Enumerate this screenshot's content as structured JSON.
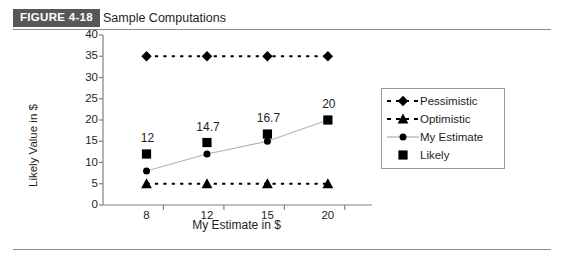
{
  "caption": {
    "badge": "FIGURE 4-18",
    "title": "Sample Computations"
  },
  "legend": {
    "items": [
      {
        "label": "Pessimistic",
        "key": "dashed-diamond-key"
      },
      {
        "label": "Optimistic",
        "key": "dashed-triangle-key"
      },
      {
        "label": "My Estimate",
        "key": "solid-circle-key"
      },
      {
        "label": "Likely",
        "key": "square-key"
      }
    ]
  },
  "chart_data": {
    "type": "line",
    "title": "Sample Computations",
    "xlabel": "My Estimate in $",
    "ylabel": "Likely Value in $",
    "categories": [
      "8",
      "12",
      "15",
      "20"
    ],
    "xtick_labels": [
      "8",
      "12",
      "15",
      "20"
    ],
    "ytick_labels": [
      "0",
      "5",
      "10",
      "15",
      "20",
      "25",
      "30",
      "35",
      "40"
    ],
    "ylim": [
      0,
      40
    ],
    "ytick_step": 5,
    "grid": false,
    "legend_position": "right",
    "series": [
      {
        "name": "Pessimistic",
        "values": [
          35,
          35,
          35,
          35
        ],
        "marker": "diamond",
        "linestyle": "dashed",
        "color": "#000000"
      },
      {
        "name": "Optimistic",
        "values": [
          5,
          5,
          5,
          5
        ],
        "marker": "triangle",
        "linestyle": "dashed",
        "color": "#000000"
      },
      {
        "name": "My Estimate",
        "values": [
          8,
          12,
          15,
          20
        ],
        "marker": "circle",
        "linestyle": "solid",
        "color": "#b3b3b3"
      },
      {
        "name": "Likely",
        "values": [
          12,
          14.7,
          16.7,
          20
        ],
        "marker": "square",
        "linestyle": "none",
        "color": "#000000",
        "data_labels": [
          "12",
          "14.7",
          "16.7",
          "20"
        ]
      }
    ],
    "annotations": [
      {
        "text": "12",
        "series": "Likely",
        "x": "8"
      },
      {
        "text": "14.7",
        "series": "Likely",
        "x": "12"
      },
      {
        "text": "16.7",
        "series": "Likely",
        "x": "15"
      },
      {
        "text": "20",
        "series": "Likely",
        "x": "20"
      }
    ]
  },
  "colors": {
    "badge_bg": "#575757",
    "badge_text": "#ffffff",
    "rule": "#8c8c8c",
    "axis": "#808080",
    "marker": "#000000",
    "estimate_line": "#b3b3b3",
    "legend_border": "#9a9a9a"
  }
}
